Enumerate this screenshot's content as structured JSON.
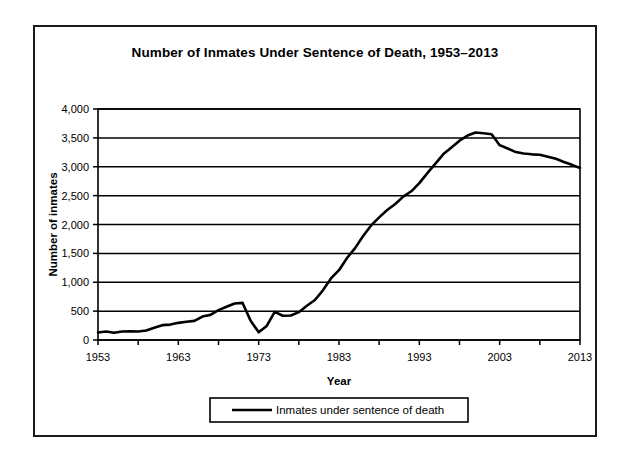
{
  "chart_data": {
    "type": "line",
    "title": "Number of Inmates Under Sentence of Death, 1953–2013",
    "xlabel": "Year",
    "ylabel": "Number of inmates",
    "xlim": [
      1953,
      2013
    ],
    "ylim": [
      0,
      4000
    ],
    "ytick_labels": [
      "0",
      "500",
      "1,000",
      "1,500",
      "2,000",
      "2,500",
      "3,000",
      "3,500",
      "4,000"
    ],
    "ytick_values": [
      0,
      500,
      1000,
      1500,
      2000,
      2500,
      3000,
      3500,
      4000
    ],
    "xtick_labels": [
      "1953",
      "1963",
      "1973",
      "1983",
      "1993",
      "2003",
      "2013"
    ],
    "xtick_values": [
      1953,
      1963,
      1973,
      1983,
      1993,
      2003,
      2013
    ],
    "xminor_step": 5,
    "grid": true,
    "legend_position": "below",
    "legend": [
      "Inmates under sentence of death"
    ],
    "series": [
      {
        "name": "Inmates under sentence of death",
        "x": [
          1953,
          1954,
          1955,
          1956,
          1957,
          1958,
          1959,
          1960,
          1961,
          1962,
          1963,
          1964,
          1965,
          1966,
          1967,
          1968,
          1969,
          1970,
          1971,
          1972,
          1973,
          1974,
          1975,
          1976,
          1977,
          1978,
          1979,
          1980,
          1981,
          1982,
          1983,
          1984,
          1985,
          1986,
          1987,
          1988,
          1989,
          1990,
          1991,
          1992,
          1993,
          1994,
          1995,
          1996,
          1997,
          1998,
          1999,
          2000,
          2001,
          2002,
          2003,
          2004,
          2005,
          2006,
          2007,
          2008,
          2009,
          2010,
          2011,
          2012,
          2013
        ],
        "values": [
          131,
          147,
          125,
          146,
          151,
          147,
          164,
          212,
          257,
          267,
          297,
          315,
          331,
          406,
          435,
          517,
          575,
          631,
          642,
          334,
          134,
          244,
          488,
          420,
          423,
          482,
          593,
          692,
          860,
          1066,
          1209,
          1420,
          1591,
          1800,
          1984,
          2124,
          2250,
          2356,
          2482,
          2575,
          2716,
          2890,
          3054,
          3219,
          3335,
          3452,
          3540,
          3593,
          3581,
          3562,
          3374,
          3315,
          3254,
          3228,
          3215,
          3207,
          3173,
          3138,
          3082,
          3033,
          2979
        ]
      }
    ]
  },
  "legend": {
    "label": "Inmates under sentence of death"
  }
}
